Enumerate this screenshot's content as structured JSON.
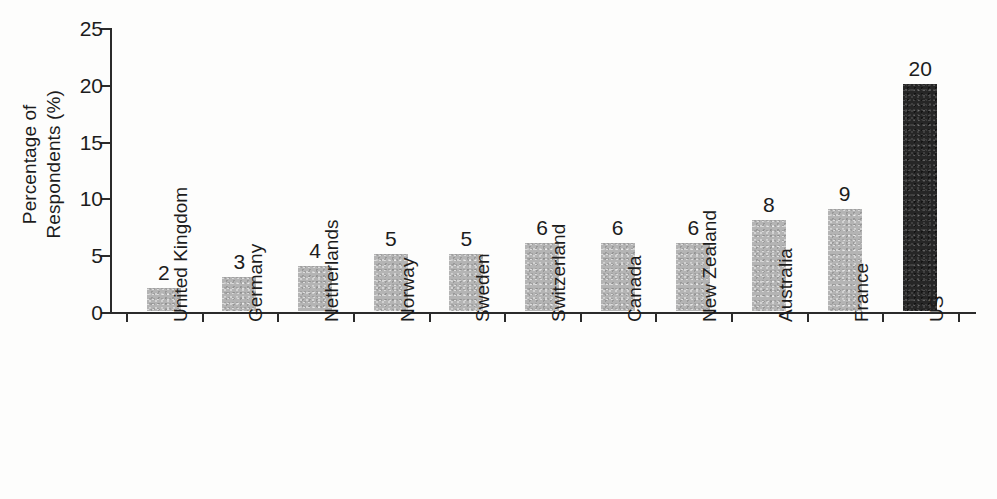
{
  "chart_data": {
    "type": "bar",
    "title": "",
    "xlabel": "",
    "ylabel": "Percentage of Respondents (%)",
    "ylabel_line1": "Percentage of",
    "ylabel_line2": "Respondents (%)",
    "ylim": [
      0,
      25
    ],
    "yticks": [
      0,
      5,
      10,
      15,
      20,
      25
    ],
    "ytick_labels": [
      "0",
      "5",
      "10",
      "15",
      "20",
      "25"
    ],
    "grid": false,
    "legend": "none",
    "categories": [
      "United Kingdom",
      "Germany",
      "Netherlands",
      "Norway",
      "Sweden",
      "Switzerland",
      "Canada",
      "New Zealand",
      "Australia",
      "France",
      "US"
    ],
    "values": [
      2,
      3,
      4,
      5,
      5,
      6,
      6,
      6,
      8,
      9,
      20
    ],
    "value_labels": [
      "2",
      "3",
      "4",
      "5",
      "5",
      "6",
      "6",
      "6",
      "8",
      "9",
      "20"
    ],
    "bar_colors": [
      "#b4b4b4",
      "#b4b4b4",
      "#b4b4b4",
      "#b4b4b4",
      "#b4b4b4",
      "#b4b4b4",
      "#b4b4b4",
      "#b4b4b4",
      "#b4b4b4",
      "#b4b4b4",
      "#262626"
    ],
    "highlight_category": "US",
    "highlight_color": "#262626",
    "default_bar_color": "#b4b4b4",
    "axis_color": "#2b2b2b",
    "background_color": "#fdfdfc"
  }
}
